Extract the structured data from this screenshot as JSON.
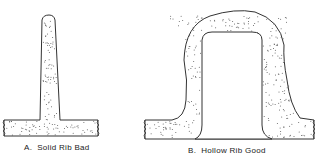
{
  "figures": [
    {
      "id": "A",
      "caption": "A.  Solid Rib Bad",
      "type": "solid-rib"
    },
    {
      "id": "B",
      "caption": "B.  Hollow Rib Good",
      "type": "hollow-rib"
    }
  ],
  "colors": {
    "stroke": "#333333",
    "fill": "#ffffff",
    "stipple": "#555555"
  }
}
